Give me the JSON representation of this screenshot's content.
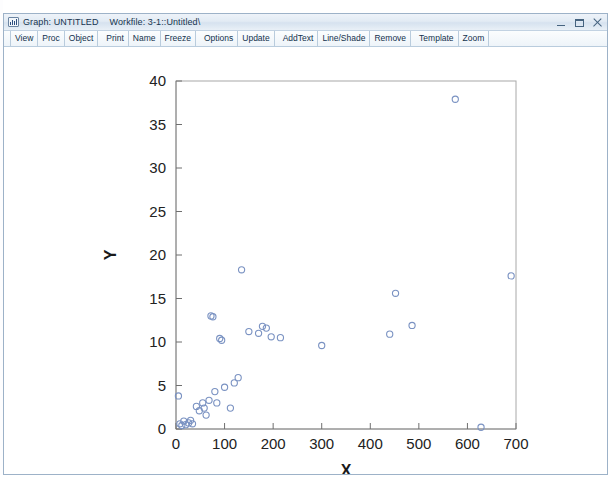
{
  "window": {
    "icon": "eviews-graph-icon",
    "title_graph": "Graph: UNTITLED",
    "title_workfile": "Workfile: 3-1::Untitled\\",
    "controls": {
      "minimize": "minimize-button",
      "maximize": "maximize-button",
      "close": "close-button"
    }
  },
  "toolbar": {
    "buttons": [
      {
        "label": "View",
        "group": 0
      },
      {
        "label": "Proc",
        "group": 0
      },
      {
        "label": "Object",
        "group": 0
      },
      {
        "label": "Print",
        "group": 1
      },
      {
        "label": "Name",
        "group": 1
      },
      {
        "label": "Freeze",
        "group": 1
      },
      {
        "label": "Options",
        "group": 2
      },
      {
        "label": "Update",
        "group": 2
      },
      {
        "label": "AddText",
        "group": 3
      },
      {
        "label": "Line/Shade",
        "group": 3
      },
      {
        "label": "Remove",
        "group": 3
      },
      {
        "label": "Template",
        "group": 4
      },
      {
        "label": "Zoom",
        "group": 4
      }
    ]
  },
  "colors": {
    "marker_stroke": "#7a92c2",
    "frame": "#a8a8a8",
    "titlebar_text": "#16344f",
    "toolbar_text": "#12314c"
  },
  "chart_data": {
    "type": "scatter",
    "title": "",
    "xlabel": "X",
    "ylabel": "Y",
    "xlim": [
      0,
      700
    ],
    "ylim": [
      0,
      40
    ],
    "xticks": [
      0,
      100,
      200,
      300,
      400,
      500,
      600,
      700
    ],
    "yticks": [
      0,
      5,
      10,
      15,
      20,
      25,
      30,
      35,
      40
    ],
    "grid": false,
    "legend": null,
    "marker": "open-circle",
    "series": [
      {
        "name": "Y vs X",
        "points": [
          [
            5,
            3.8
          ],
          [
            8,
            0.6
          ],
          [
            12,
            0.4
          ],
          [
            16,
            0.9
          ],
          [
            20,
            0.5
          ],
          [
            26,
            0.7
          ],
          [
            30,
            1.0
          ],
          [
            34,
            0.6
          ],
          [
            42,
            2.6
          ],
          [
            48,
            2.1
          ],
          [
            55,
            3.0
          ],
          [
            58,
            2.4
          ],
          [
            62,
            1.6
          ],
          [
            68,
            3.3
          ],
          [
            72,
            13.0
          ],
          [
            76,
            12.9
          ],
          [
            80,
            4.3
          ],
          [
            84,
            3.0
          ],
          [
            90,
            10.4
          ],
          [
            94,
            10.2
          ],
          [
            100,
            4.8
          ],
          [
            112,
            2.4
          ],
          [
            120,
            5.3
          ],
          [
            128,
            5.9
          ],
          [
            135,
            18.3
          ],
          [
            150,
            11.2
          ],
          [
            170,
            11.0
          ],
          [
            178,
            11.8
          ],
          [
            186,
            11.6
          ],
          [
            196,
            10.6
          ],
          [
            215,
            10.5
          ],
          [
            300,
            9.6
          ],
          [
            440,
            10.9
          ],
          [
            452,
            15.6
          ],
          [
            486,
            11.9
          ],
          [
            575,
            37.9
          ],
          [
            628,
            0.2
          ],
          [
            690,
            17.6
          ]
        ]
      }
    ]
  }
}
